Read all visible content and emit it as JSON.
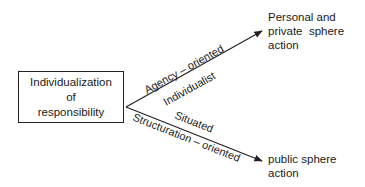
{
  "source_node": {
    "lines": [
      "Individualization",
      "of",
      "responsibility"
    ]
  },
  "targets": [
    {
      "lines": [
        "Personal and",
        "private  sphere",
        "action"
      ]
    },
    {
      "lines": [
        "public sphere",
        "action"
      ]
    }
  ],
  "edges": [
    {
      "from": "source_node",
      "to": "targets.0",
      "label_above": "Agency – oriented",
      "label_below": "Individualist"
    },
    {
      "from": "source_node",
      "to": "targets.1",
      "label_above": "Situated",
      "label_below": "Structuration – oriented"
    }
  ],
  "colors": {
    "line": "#222222",
    "text": "#1a1a1a",
    "background": "#ffffff"
  }
}
